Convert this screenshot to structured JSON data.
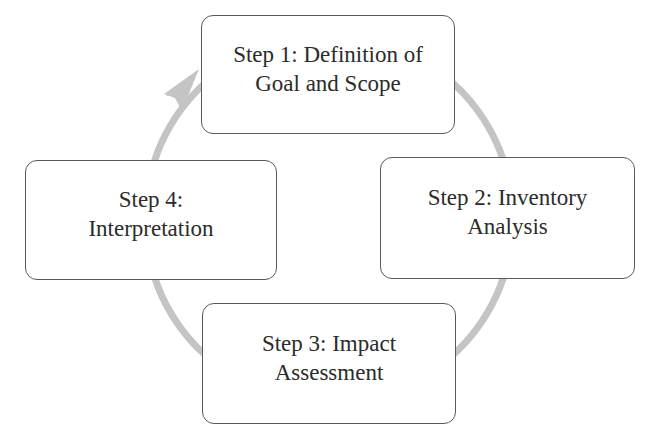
{
  "diagram": {
    "type": "cycle",
    "direction": "clockwise",
    "arrow_color": "#c4c4c4",
    "box_border_color": "#5a5a5a",
    "text_color": "#2b2b2b",
    "steps": [
      {
        "id": "step1",
        "line1": "Step 1: Definition of",
        "line2": "Goal and Scope"
      },
      {
        "id": "step2",
        "line1": "Step 2: Inventory",
        "line2": "Analysis"
      },
      {
        "id": "step3",
        "line1": "Step 3: Impact",
        "line2": "Assessment"
      },
      {
        "id": "step4",
        "line1": "Step 4:",
        "line2": "Interpretation"
      }
    ],
    "edges": [
      {
        "from": "step1",
        "to": "step2"
      },
      {
        "from": "step2",
        "to": "step3"
      },
      {
        "from": "step3",
        "to": "step4"
      },
      {
        "from": "step4",
        "to": "step1",
        "arrowhead": true
      }
    ]
  }
}
